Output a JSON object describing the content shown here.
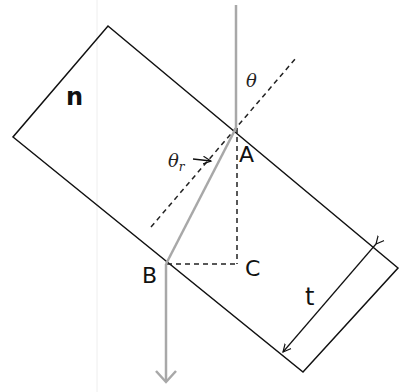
{
  "diagram": {
    "type": "refraction-through-slab",
    "labels": {
      "medium_index": "n",
      "incident_angle": "θ",
      "refracted_angle": "θ",
      "refracted_angle_sub": "r",
      "point_a": "A",
      "point_b": "B",
      "point_c": "C",
      "thickness": "t"
    },
    "colors": {
      "slab_outline": "#111111",
      "ray": "#a8a8a8",
      "dashed": "#222222",
      "background": "#ffffff"
    }
  }
}
